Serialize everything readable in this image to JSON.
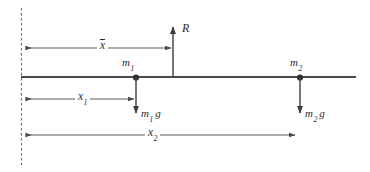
{
  "figure": {
    "stroke_color": "#4a4a4a",
    "text_color": "#2b2b2b",
    "background_color": "#ffffff"
  },
  "beam": {
    "name": "horizontal-beam",
    "x_start": 21,
    "x_end": 356,
    "y": 77
  },
  "datum": {
    "name": "vertical-datum-dashed-line",
    "x": 21,
    "y_top": 8,
    "y_bottom": 165,
    "style": "dashed"
  },
  "masses": [
    {
      "id": "m1",
      "label": "m",
      "subscript": "1",
      "point_x": 136,
      "point_y": 77,
      "label_x": 122,
      "label_y": 60,
      "weight_label": "m",
      "weight_subscript": "1",
      "weight_g": "g",
      "weight_arrow_y_end": 115,
      "weight_label_x": 140,
      "weight_label_y": 110
    },
    {
      "id": "m2",
      "label": "m",
      "subscript": "2",
      "point_x": 300,
      "point_y": 77,
      "label_x": 291,
      "label_y": 60,
      "weight_label": "m",
      "weight_subscript": "2",
      "weight_g": "g",
      "weight_arrow_y_end": 115,
      "weight_label_x": 304,
      "weight_label_y": 110
    }
  ],
  "reaction": {
    "name": "reaction-force-R",
    "label": "R",
    "x": 173,
    "arrow_tip_y": 25,
    "base_y": 77,
    "label_x": 182,
    "label_y": 24
  },
  "dimensions": [
    {
      "id": "xbar",
      "name": "dimension-x-bar",
      "label": "x",
      "subscript": "",
      "overbar": true,
      "x_from": 24,
      "x_to": 173,
      "y": 48,
      "label_x": 99,
      "label_y": 41,
      "arrowheads": "both"
    },
    {
      "id": "x1",
      "name": "dimension-x1",
      "label": "x",
      "subscript": "1",
      "overbar": false,
      "x_from": 24,
      "x_to": 136,
      "y": 99,
      "label_x": 77,
      "label_y": 92,
      "arrowheads": "both"
    },
    {
      "id": "x2",
      "name": "dimension-x2",
      "label": "x",
      "subscript": "2",
      "overbar": false,
      "x_from": 24,
      "x_to": 297,
      "y": 135,
      "label_x": 147,
      "label_y": 128,
      "arrowheads": "both"
    }
  ]
}
